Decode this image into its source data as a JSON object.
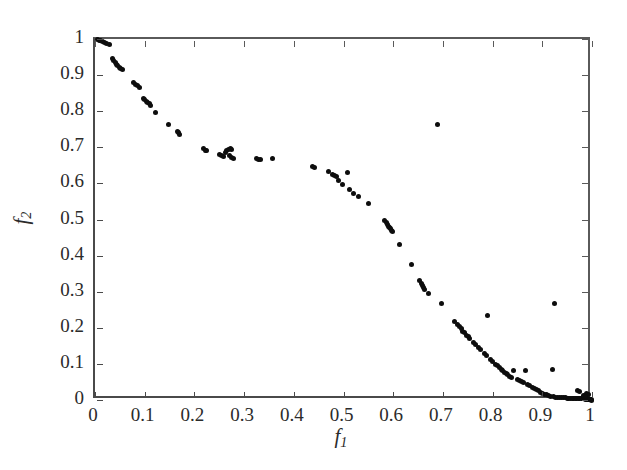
{
  "figure": {
    "background": "#ffffff",
    "marker_color": "#0d0d0d",
    "axis_color": "#4a4a4a"
  },
  "axis_titles": {
    "x_base": "f",
    "x_sub": "1",
    "y_base": "f",
    "y_sub": "2"
  },
  "chart_data": {
    "type": "scatter",
    "title": "",
    "xlabel": "f1",
    "ylabel": "f2",
    "xlim": [
      0,
      1
    ],
    "ylim": [
      0,
      1
    ],
    "grid": false,
    "legend": null,
    "xticks": [
      0,
      0.1,
      0.2,
      0.3,
      0.4,
      0.5,
      0.6,
      0.7,
      0.8,
      0.9,
      1
    ],
    "yticks": [
      0,
      0.1,
      0.2,
      0.3,
      0.4,
      0.5,
      0.6,
      0.7,
      0.8,
      0.9,
      1
    ],
    "xticklabels": [
      "0",
      "0.1",
      "0.2",
      "0.3",
      "0.4",
      "0.5",
      "0.6",
      "0.7",
      "0.8",
      "0.9",
      "1"
    ],
    "yticklabels": [
      "0",
      "0.1",
      "0.2",
      "0.3",
      "0.4",
      "0.5",
      "0.6",
      "0.7",
      "0.8",
      "0.9",
      "1"
    ],
    "marker": "filled-circle",
    "marker_size": 5,
    "series": [
      {
        "name": "Pareto front approximation",
        "color": "#0d0d0d",
        "points": [
          [
            0.005,
            0.999
          ],
          [
            0.009,
            0.997
          ],
          [
            0.012,
            0.995
          ],
          [
            0.016,
            0.994
          ],
          [
            0.02,
            0.99
          ],
          [
            0.024,
            0.988
          ],
          [
            0.03,
            0.985
          ],
          [
            0.036,
            0.946
          ],
          [
            0.038,
            0.941
          ],
          [
            0.041,
            0.936
          ],
          [
            0.044,
            0.93
          ],
          [
            0.046,
            0.926
          ],
          [
            0.049,
            0.922
          ],
          [
            0.052,
            0.919
          ],
          [
            0.056,
            0.915
          ],
          [
            0.078,
            0.879
          ],
          [
            0.081,
            0.874
          ],
          [
            0.085,
            0.87
          ],
          [
            0.089,
            0.866
          ],
          [
            0.097,
            0.836
          ],
          [
            0.1,
            0.832
          ],
          [
            0.103,
            0.828
          ],
          [
            0.106,
            0.824
          ],
          [
            0.109,
            0.82
          ],
          [
            0.112,
            0.817
          ],
          [
            0.122,
            0.796
          ],
          [
            0.148,
            0.764
          ],
          [
            0.165,
            0.745
          ],
          [
            0.168,
            0.74
          ],
          [
            0.17,
            0.736
          ],
          [
            0.219,
            0.696
          ],
          [
            0.222,
            0.692
          ],
          [
            0.225,
            0.69
          ],
          [
            0.251,
            0.679
          ],
          [
            0.255,
            0.676
          ],
          [
            0.258,
            0.674
          ],
          [
            0.262,
            0.685
          ],
          [
            0.265,
            0.69
          ],
          [
            0.268,
            0.694
          ],
          [
            0.272,
            0.698
          ],
          [
            0.275,
            0.695
          ],
          [
            0.271,
            0.676
          ],
          [
            0.275,
            0.672
          ],
          [
            0.278,
            0.669
          ],
          [
            0.325,
            0.669
          ],
          [
            0.329,
            0.667
          ],
          [
            0.333,
            0.666
          ],
          [
            0.358,
            0.668
          ],
          [
            0.437,
            0.646
          ],
          [
            0.441,
            0.644
          ],
          [
            0.47,
            0.634
          ],
          [
            0.478,
            0.625
          ],
          [
            0.481,
            0.622
          ],
          [
            0.485,
            0.618
          ],
          [
            0.489,
            0.607
          ],
          [
            0.497,
            0.597
          ],
          [
            0.508,
            0.63
          ],
          [
            0.512,
            0.583
          ],
          [
            0.52,
            0.573
          ],
          [
            0.53,
            0.563
          ],
          [
            0.551,
            0.543
          ],
          [
            0.583,
            0.497
          ],
          [
            0.586,
            0.492
          ],
          [
            0.588,
            0.487
          ],
          [
            0.59,
            0.482
          ],
          [
            0.592,
            0.478
          ],
          [
            0.594,
            0.474
          ],
          [
            0.596,
            0.47
          ],
          [
            0.598,
            0.466
          ],
          [
            0.612,
            0.432
          ],
          [
            0.637,
            0.374
          ],
          [
            0.653,
            0.33
          ],
          [
            0.656,
            0.323
          ],
          [
            0.658,
            0.317
          ],
          [
            0.661,
            0.311
          ],
          [
            0.663,
            0.305
          ],
          [
            0.671,
            0.296
          ],
          [
            0.69,
            0.762
          ],
          [
            0.697,
            0.267
          ],
          [
            0.724,
            0.218
          ],
          [
            0.73,
            0.21
          ],
          [
            0.734,
            0.203
          ],
          [
            0.737,
            0.197
          ],
          [
            0.74,
            0.191
          ],
          [
            0.744,
            0.186
          ],
          [
            0.747,
            0.18
          ],
          [
            0.751,
            0.175
          ],
          [
            0.754,
            0.17
          ],
          [
            0.762,
            0.159
          ],
          [
            0.766,
            0.153
          ],
          [
            0.772,
            0.145
          ],
          [
            0.776,
            0.139
          ],
          [
            0.784,
            0.128
          ],
          [
            0.788,
            0.123
          ],
          [
            0.79,
            0.234
          ],
          [
            0.795,
            0.112
          ],
          [
            0.799,
            0.107
          ],
          [
            0.805,
            0.099
          ],
          [
            0.809,
            0.095
          ],
          [
            0.813,
            0.089
          ],
          [
            0.817,
            0.085
          ],
          [
            0.82,
            0.081
          ],
          [
            0.823,
            0.077
          ],
          [
            0.827,
            0.073
          ],
          [
            0.83,
            0.07
          ],
          [
            0.834,
            0.066
          ],
          [
            0.838,
            0.063
          ],
          [
            0.843,
            0.082
          ],
          [
            0.85,
            0.058
          ],
          [
            0.854,
            0.055
          ],
          [
            0.858,
            0.052
          ],
          [
            0.862,
            0.049
          ],
          [
            0.867,
            0.082
          ],
          [
            0.871,
            0.044
          ],
          [
            0.875,
            0.041
          ],
          [
            0.88,
            0.036
          ],
          [
            0.884,
            0.033
          ],
          [
            0.888,
            0.029
          ],
          [
            0.892,
            0.026
          ],
          [
            0.896,
            0.022
          ],
          [
            0.9,
            0.019
          ],
          [
            0.905,
            0.016
          ],
          [
            0.909,
            0.014
          ],
          [
            0.913,
            0.012
          ],
          [
            0.917,
            0.01
          ],
          [
            0.92,
            0.084
          ],
          [
            0.925,
            0.266
          ],
          [
            0.922,
            0.009
          ],
          [
            0.926,
            0.008
          ],
          [
            0.93,
            0.007
          ],
          [
            0.934,
            0.007
          ],
          [
            0.938,
            0.006
          ],
          [
            0.942,
            0.006
          ],
          [
            0.946,
            0.006
          ],
          [
            0.95,
            0.005
          ],
          [
            0.953,
            0.005
          ],
          [
            0.957,
            0.005
          ],
          [
            0.96,
            0.005
          ],
          [
            0.963,
            0.004
          ],
          [
            0.966,
            0.004
          ],
          [
            0.969,
            0.004
          ],
          [
            0.971,
            0.026
          ],
          [
            0.974,
            0.024
          ],
          [
            0.972,
            0.004
          ],
          [
            0.975,
            0.004
          ],
          [
            0.978,
            0.003
          ],
          [
            0.98,
            0.003
          ],
          [
            0.982,
            0.003
          ],
          [
            0.984,
            0.003
          ],
          [
            0.986,
            0.002
          ],
          [
            0.988,
            0.002
          ],
          [
            0.99,
            0.002
          ],
          [
            0.992,
            0.002
          ],
          [
            0.993,
            0.001
          ],
          [
            0.995,
            0.001
          ],
          [
            0.996,
            0.001
          ],
          [
            0.997,
            0.001
          ],
          [
            0.998,
            0.001
          ],
          [
            0.999,
            0.0
          ],
          [
            0.988,
            0.018
          ],
          [
            0.992,
            0.014
          ],
          [
            0.983,
            0.013
          ],
          [
            0.986,
            0.01
          ]
        ]
      }
    ]
  }
}
